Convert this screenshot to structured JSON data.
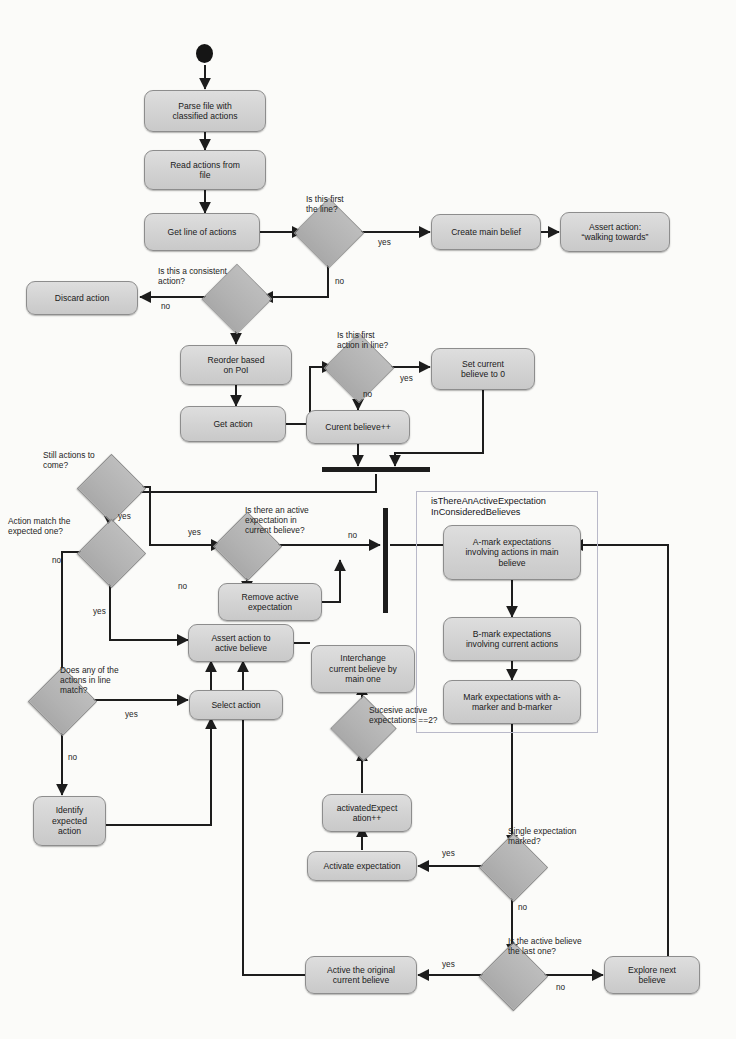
{
  "diagram": {
    "colors": {
      "node_fill": "#d4d4d4",
      "node_border": "#8d8d8d",
      "decision_fill": "#b4b4b4",
      "decision_border": "#8a8a8a",
      "line": "#1d1d1d",
      "group_border": "#b9b9c9",
      "background": "#fbfbf9"
    },
    "start_node": "start",
    "group": {
      "title": "isThereAnActiveExpectation\nInConsideredBelieves"
    },
    "nodes": [
      {
        "id": "parse_file",
        "label": "Parse file with\nclassified actions"
      },
      {
        "id": "read_actions",
        "label": "Read actions from\nfile"
      },
      {
        "id": "get_line",
        "label": "Get line of actions"
      },
      {
        "id": "create_main",
        "label": "Create main belief"
      },
      {
        "id": "assert_walking",
        "label": "Assert action:\n“walking towards”"
      },
      {
        "id": "discard_action",
        "label": "Discard action"
      },
      {
        "id": "reorder_poi",
        "label": "Reorder based\non PoI"
      },
      {
        "id": "get_action",
        "label": "Get action"
      },
      {
        "id": "set_current_0",
        "label": "Set current\nbelieve to 0"
      },
      {
        "id": "current_pp",
        "label": "Curent believe++"
      },
      {
        "id": "remove_active_exp",
        "label": "Remove active\nexpectation"
      },
      {
        "id": "assert_active",
        "label": "Assert action to\nactive believe"
      },
      {
        "id": "select_action",
        "label": "Select action"
      },
      {
        "id": "identify_expected",
        "label": "Identify\nexpected\naction"
      },
      {
        "id": "interchange",
        "label": "Interchange\ncurrent believe by\nmain one"
      },
      {
        "id": "activated_pp",
        "label": "activatedExpect\nation++"
      },
      {
        "id": "activate_exp",
        "label": "Activate expectation"
      },
      {
        "id": "active_original",
        "label": "Active the original\ncurrent believe"
      },
      {
        "id": "explore_next",
        "label": "Explore next\nbelieve"
      },
      {
        "id": "a_mark",
        "label": "A-mark expectations\ninvolving actions in main\nbelieve"
      },
      {
        "id": "b_mark",
        "label": "B-mark expectations\ninvolving  current actions"
      },
      {
        "id": "mark_ab",
        "label": "Mark expectations with a-\nmarker and b-marker"
      }
    ],
    "decisions": [
      {
        "id": "d_first_line",
        "label": "Is this first\nthe line?"
      },
      {
        "id": "d_consistent",
        "label": "Is this a consistent\naction?"
      },
      {
        "id": "d_first_action",
        "label": "Is this first\naction in line?"
      },
      {
        "id": "d_still_actions",
        "label": "Still actions to\ncome?"
      },
      {
        "id": "d_action_match",
        "label": "Action match the\nexpected one?"
      },
      {
        "id": "d_active_exp",
        "label": "Is there an active\nexpectation in\ncurrent believe?"
      },
      {
        "id": "d_any_match",
        "label": "Does any of the\nactions in line\nmatch?"
      },
      {
        "id": "d_succesive",
        "label": "Sucesive active\nexpectations ==2?"
      },
      {
        "id": "d_single_exp",
        "label": "Single expectation\nmarked?"
      },
      {
        "id": "d_last_believe",
        "label": "Is the active believe\nthe last one?"
      }
    ],
    "edge_labels": {
      "first_line_yes": "yes",
      "first_line_no": "no",
      "consistent_no": "no",
      "first_action_yes": "yes",
      "first_action_no": "no",
      "still_actions_yes": "yes",
      "still_actions_yes2": "yes",
      "action_match_no": "no",
      "action_match_yes": "yes",
      "active_exp_no": "no",
      "active_exp_no2": "no",
      "any_match_yes": "yes",
      "any_match_no": "no",
      "single_exp_yes": "yes",
      "single_exp_no": "no",
      "last_believe_yes": "yes",
      "last_believe_no": "no"
    }
  }
}
